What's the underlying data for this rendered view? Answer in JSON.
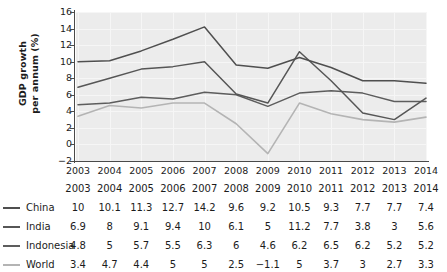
{
  "chart_data": {
    "type": "line",
    "title": "",
    "xlabel": "",
    "ylabel": "GDP growth\nper annum (%)",
    "x": [
      2003,
      2004,
      2005,
      2006,
      2007,
      2008,
      2009,
      2010,
      2011,
      2012,
      2013,
      2014
    ],
    "categories": [
      "2003",
      "2004",
      "2005",
      "2006",
      "2007",
      "2008",
      "2009",
      "2010",
      "2011",
      "2012",
      "2013",
      "2014"
    ],
    "ylim": [
      -2,
      16
    ],
    "yticks": [
      -2,
      0,
      2,
      4,
      6,
      8,
      10,
      12,
      14,
      16
    ],
    "ytick_labels": [
      "−2",
      "0",
      "2",
      "4",
      "6",
      "8",
      "10",
      "12",
      "14",
      "16"
    ],
    "grid": true,
    "legend_position": "table-left",
    "series": [
      {
        "name": "China",
        "color": "#4f4f4f",
        "values": [
          10,
          10.1,
          11.3,
          12.7,
          14.2,
          9.6,
          9.2,
          10.5,
          9.3,
          7.7,
          7.7,
          7.4
        ],
        "labels": [
          "10",
          "10.1",
          "11.3",
          "12.7",
          "14.2",
          "9.6",
          "9.2",
          "10.5",
          "9.3",
          "7.7",
          "7.7",
          "7.4"
        ]
      },
      {
        "name": "India",
        "color": "#565656",
        "values": [
          6.9,
          8,
          9.1,
          9.4,
          10,
          6.1,
          5,
          11.2,
          7.7,
          3.8,
          3,
          5.6
        ],
        "labels": [
          "6.9",
          "8",
          "9.1",
          "9.4",
          "10",
          "6.1",
          "5",
          "11.2",
          "7.7",
          "3.8",
          "3",
          "5.6"
        ]
      },
      {
        "name": "Indonesia",
        "color": "#5d5d5d",
        "values": [
          4.8,
          5,
          5.7,
          5.5,
          6.3,
          6,
          4.6,
          6.2,
          6.5,
          6.2,
          5.2,
          5.2
        ],
        "labels": [
          "4.8",
          "5",
          "5.7",
          "5.5",
          "6.3",
          "6",
          "4.6",
          "6.2",
          "6.5",
          "6.2",
          "5.2",
          "5.2"
        ]
      },
      {
        "name": "World",
        "color": "#b4b4b4",
        "values": [
          3.4,
          4.7,
          4.4,
          5,
          5,
          2.5,
          -1.1,
          5,
          3.7,
          3,
          2.7,
          3.3
        ],
        "labels": [
          "3.4",
          "4.7",
          "4.4",
          "5",
          "5",
          "2.5",
          "−1.1",
          "5",
          "3.7",
          "3",
          "2.7",
          "3.3"
        ]
      }
    ]
  },
  "plot_area": {
    "background_color": "#ececec",
    "gridline_color": "#f6f6f6",
    "axis_color": "#4a4a4a"
  }
}
